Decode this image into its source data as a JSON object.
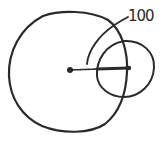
{
  "diagram": {
    "type": "hand-drawn geometric sketch",
    "stroke_color": "#2a2a2a",
    "background": "#ffffff",
    "label": {
      "text": "100"
    },
    "elements": {
      "large_circle": {
        "description": "large circle around center point"
      },
      "center_point": {
        "description": "filled dot at center of large circle"
      },
      "radius_line": {
        "description": "radius from center to edge of large circle"
      },
      "small_circle": {
        "description": "small circle centered on the end of the radius line"
      },
      "arc_leader": {
        "description": "arc with leader line pointing to label 100"
      }
    }
  }
}
